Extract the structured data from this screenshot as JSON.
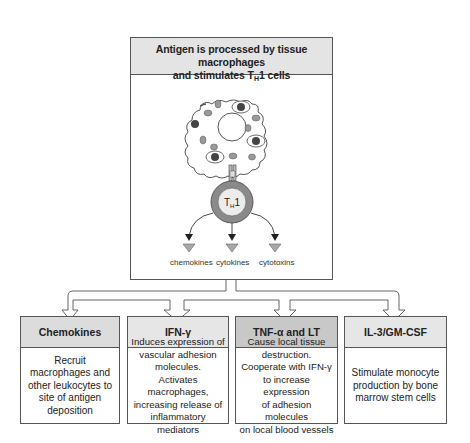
{
  "title": {
    "line1": "Antigen is processed by tissue macrophages",
    "line2_pre": "and stimulates T",
    "line2_sub": "H",
    "line2_post": "1 cells"
  },
  "illustration": {
    "cell_label": "TH1",
    "cell_label_main": "T",
    "cell_label_sub": "H",
    "cell_label_post": "1",
    "products": [
      "chemokines",
      "cytokines",
      "cytotoxins"
    ]
  },
  "effects": [
    {
      "header": "Chemokines",
      "body": "Recruit\nmacrophages and\nother leukocytes to\nsite of antigen\ndeposition",
      "header_color": "#dcdcdc"
    },
    {
      "header": "IFN-γ",
      "body": "Induces expression of\nvascular adhesion\nmolecules.\nActivates macrophages,\nincreasing release of\ninflammatory mediators",
      "header_color": "#e6e6e6"
    },
    {
      "header": "TNF-α and LT",
      "body": "Cause local tissue\ndestruction.\nCooperate with IFN-γ\nto increase expression\nof adhesion molecules\non local blood vessels",
      "header_color": "#c8c8c8"
    },
    {
      "header": "IL-3/GM-CSF",
      "body": "Stimulate monocyte\nproduction by bone\nmarrow stem cells",
      "header_color": "#e6e6e6"
    }
  ],
  "colors": {
    "border": "#555555",
    "header_light": "#e4e4e4",
    "cell_ring": "#8a8a8a",
    "triangle": "#a8a8a8"
  }
}
